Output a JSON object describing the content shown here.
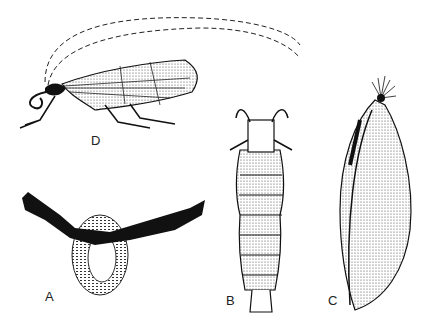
{
  "figure": {
    "panels": [
      {
        "id": "D",
        "label": "D",
        "subject": "adult caddisfly (side view)"
      },
      {
        "id": "A",
        "label": "A",
        "subject": "egg mass ring on twig"
      },
      {
        "id": "B",
        "label": "B",
        "subject": "larva (dorsal view)"
      },
      {
        "id": "C",
        "label": "C",
        "subject": "pupa (side view)"
      }
    ],
    "colors": {
      "ink": "#111111",
      "background": "#ffffff"
    }
  }
}
